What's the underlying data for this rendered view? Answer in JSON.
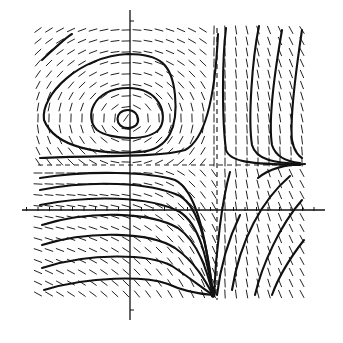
{
  "diagram": {
    "type": "phase-portrait",
    "colors": {
      "ink": "#111111",
      "background": "#ffffff"
    },
    "axes": {
      "x_axis": {
        "y": 210,
        "x_from": 22,
        "x_to": 325,
        "tick_spacing": 11.5
      },
      "y_axis": {
        "x": 130,
        "y_from": 10,
        "y_to": 320,
        "tick_spacing": 11.5
      }
    },
    "separatrices": {
      "vertical_dashed_x": 217,
      "horizontal_dashed_y": 165
    },
    "center": {
      "x": 128,
      "y": 119
    },
    "field_bounds": {
      "x0": 38,
      "x1": 305,
      "y0": 30,
      "y1": 300,
      "step": 11
    }
  }
}
